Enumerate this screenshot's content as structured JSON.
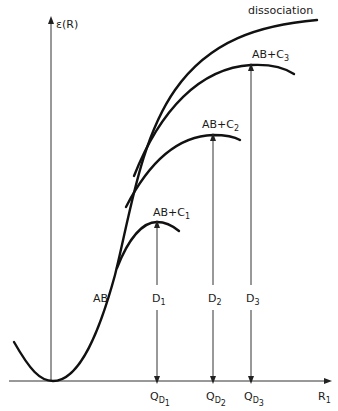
{
  "diagram": {
    "y_axis_label": "ε(R)",
    "x_axis_label": {
      "main": "R",
      "sub": "1"
    },
    "curves": [
      {
        "id": "AB",
        "label": "AB"
      },
      {
        "id": "dissociation",
        "label": "dissociation"
      },
      {
        "id": "AB+C1",
        "label": "AB+C",
        "sub": "1"
      },
      {
        "id": "AB+C2",
        "label": "AB+C",
        "sub": "2"
      },
      {
        "id": "AB+C3",
        "label": "AB+C",
        "sub": "3"
      }
    ],
    "energy_gaps": [
      {
        "label": "D",
        "sub": "1",
        "q_label": "Q",
        "q_sub": "D",
        "q_subsub": "1"
      },
      {
        "label": "D",
        "sub": "2",
        "q_label": "Q",
        "q_sub": "D",
        "q_subsub": "2"
      },
      {
        "label": "D",
        "sub": "3",
        "q_label": "Q",
        "q_sub": "D",
        "q_subsub": "3"
      }
    ]
  }
}
